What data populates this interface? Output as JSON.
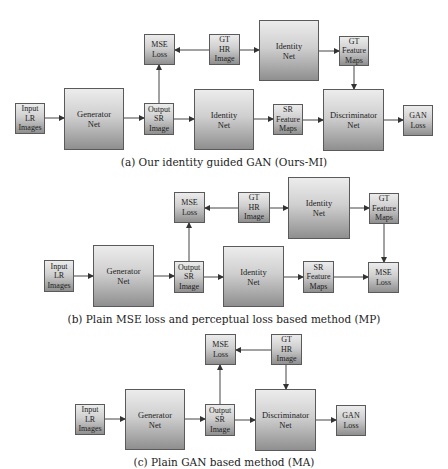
{
  "diagrams": [
    {
      "id": "a",
      "caption": "(a) Our identity guided GAN (Ours-MI)",
      "caption_y": 156,
      "boxes": [
        {
          "key": "input",
          "label": "Input\nLR\nImages",
          "x": 15,
          "y": 103,
          "w": 30,
          "h": 31,
          "big": false
        },
        {
          "key": "generator",
          "label": "Generator\nNet",
          "x": 64,
          "y": 88,
          "w": 60,
          "h": 62,
          "big": true
        },
        {
          "key": "output",
          "label": "Output\nSR\nImage",
          "x": 144,
          "y": 103,
          "w": 30,
          "h": 32,
          "big": false
        },
        {
          "key": "mse",
          "label": "MSE\nLoss",
          "x": 144,
          "y": 34,
          "w": 31,
          "h": 31,
          "big": false
        },
        {
          "key": "gthr",
          "label": "GT\nHR\nImage",
          "x": 209,
          "y": 34,
          "w": 31,
          "h": 31,
          "big": false
        },
        {
          "key": "identity_top",
          "label": "Identity\nNet",
          "x": 259,
          "y": 20,
          "w": 60,
          "h": 61,
          "big": true
        },
        {
          "key": "gtfeat",
          "label": "GT\nFeature\nMaps",
          "x": 339,
          "y": 36,
          "w": 30,
          "h": 30,
          "big": false
        },
        {
          "key": "identity_bottom",
          "label": "Identity\nNet",
          "x": 194,
          "y": 89,
          "w": 60,
          "h": 61,
          "big": true
        },
        {
          "key": "srfeat",
          "label": "SR\nFeature\nMaps",
          "x": 273,
          "y": 104,
          "w": 30,
          "h": 31,
          "big": false
        },
        {
          "key": "disc",
          "label": "Discriminator\nNet",
          "x": 323,
          "y": 89,
          "w": 61,
          "h": 62,
          "big": true
        },
        {
          "key": "ganloss",
          "label": "GAN\nLoss",
          "x": 403,
          "y": 105,
          "w": 30,
          "h": 31,
          "big": false
        }
      ],
      "arrows": [
        [
          45,
          118,
          64,
          118
        ],
        [
          124,
          118,
          144,
          118
        ],
        [
          159,
          103,
          159,
          65
        ],
        [
          209,
          50,
          175,
          50
        ],
        [
          240,
          50,
          259,
          50
        ],
        [
          319,
          51,
          339,
          51
        ],
        [
          174,
          119,
          194,
          119
        ],
        [
          254,
          119,
          273,
          119
        ],
        [
          303,
          120,
          323,
          120
        ],
        [
          354,
          66,
          354,
          89
        ],
        [
          384,
          120,
          403,
          120
        ]
      ]
    },
    {
      "id": "b",
      "caption": "(b) Plain MSE loss and perceptual loss based method (MP)",
      "caption_y": 313,
      "boxes": [
        {
          "key": "input",
          "label": "Input\nLR\nImages",
          "x": 44,
          "y": 260,
          "w": 30,
          "h": 32,
          "big": false
        },
        {
          "key": "generator",
          "label": "Generator\nNet",
          "x": 93,
          "y": 245,
          "w": 61,
          "h": 62,
          "big": true
        },
        {
          "key": "output",
          "label": "Output\nSR\nImage",
          "x": 174,
          "y": 261,
          "w": 30,
          "h": 32,
          "big": false
        },
        {
          "key": "mse",
          "label": "MSE\nLoss",
          "x": 174,
          "y": 192,
          "w": 31,
          "h": 31,
          "big": false
        },
        {
          "key": "gthr",
          "label": "GT\nHR\nImage",
          "x": 238,
          "y": 192,
          "w": 32,
          "h": 31,
          "big": false
        },
        {
          "key": "identity_top",
          "label": "Identity\nNet",
          "x": 288,
          "y": 177,
          "w": 62,
          "h": 62,
          "big": true
        },
        {
          "key": "gtfeat",
          "label": "GT\nFeature\nMaps",
          "x": 369,
          "y": 193,
          "w": 30,
          "h": 31,
          "big": false
        },
        {
          "key": "identity_bottom",
          "label": "Identity\nNet",
          "x": 223,
          "y": 246,
          "w": 61,
          "h": 61,
          "big": true
        },
        {
          "key": "srfeat",
          "label": "SR\nFeature\nMaps",
          "x": 303,
          "y": 261,
          "w": 31,
          "h": 32,
          "big": false
        },
        {
          "key": "mse_right",
          "label": "MSE\nLoss",
          "x": 368,
          "y": 262,
          "w": 31,
          "h": 31,
          "big": false
        }
      ],
      "arrows": [
        [
          74,
          276,
          93,
          276
        ],
        [
          154,
          276,
          174,
          276
        ],
        [
          189,
          261,
          189,
          223
        ],
        [
          238,
          208,
          205,
          208
        ],
        [
          270,
          208,
          288,
          208
        ],
        [
          350,
          208,
          369,
          208
        ],
        [
          204,
          277,
          223,
          277
        ],
        [
          284,
          277,
          303,
          277
        ],
        [
          334,
          277,
          368,
          277
        ],
        [
          384,
          224,
          384,
          262
        ]
      ]
    },
    {
      "id": "c",
      "caption": "(c) Plain GAN based method (MA)",
      "caption_y": 456,
      "boxes": [
        {
          "key": "input",
          "label": "Input\nLR\nImages",
          "x": 75,
          "y": 404,
          "w": 30,
          "h": 31,
          "big": false
        },
        {
          "key": "generator",
          "label": "Generator\nNet",
          "x": 125,
          "y": 389,
          "w": 60,
          "h": 61,
          "big": true
        },
        {
          "key": "output",
          "label": "Output\nSR\nImage",
          "x": 205,
          "y": 404,
          "w": 30,
          "h": 32,
          "big": false
        },
        {
          "key": "mse",
          "label": "MSE\nLoss",
          "x": 205,
          "y": 334,
          "w": 31,
          "h": 31,
          "big": false
        },
        {
          "key": "gthr",
          "label": "GT\nHR\nImage",
          "x": 271,
          "y": 334,
          "w": 31,
          "h": 31,
          "big": false
        },
        {
          "key": "disc",
          "label": "Discriminator\nNet",
          "x": 255,
          "y": 389,
          "w": 61,
          "h": 62,
          "big": true
        },
        {
          "key": "ganloss",
          "label": "GAN\nLoss",
          "x": 336,
          "y": 405,
          "w": 30,
          "h": 31,
          "big": false
        }
      ],
      "arrows": [
        [
          105,
          419,
          125,
          419
        ],
        [
          185,
          419,
          205,
          419
        ],
        [
          220,
          404,
          220,
          365
        ],
        [
          271,
          350,
          236,
          350
        ],
        [
          286,
          365,
          286,
          389
        ],
        [
          235,
          420,
          255,
          420
        ],
        [
          316,
          420,
          336,
          420
        ]
      ]
    }
  ],
  "style": {
    "arrow_color": "#444444",
    "box_border": "#5a5a5a"
  }
}
